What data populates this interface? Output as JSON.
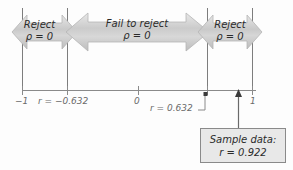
{
  "figure": {
    "axis": {
      "min_label": "−1",
      "zero_label": "0",
      "max_label": "1",
      "critical_low_label": "r = −0.632",
      "critical_high_label": "r = 0.632"
    },
    "bands": [
      {
        "name": "reject-left",
        "line1": "Reject",
        "line2": "ρ = 0"
      },
      {
        "name": "fail-to-reject",
        "line1": "Fail to reject",
        "line2": "ρ = 0"
      },
      {
        "name": "reject-right",
        "line1": "Reject",
        "line2": "ρ = 0"
      }
    ],
    "callout": {
      "line1": "Sample data:",
      "line2": "r = 0.922"
    },
    "colors": {
      "arrow_fill": "#cfcfcf",
      "arrow_stroke": "#b3b3b3",
      "axis": "#8a8a8a",
      "divider": "#7d7d7d",
      "text": "#2b2b2b",
      "label_text": "#6a6a6a",
      "callout_fill": "#e8e8e8",
      "callout_stroke": "#8a8a8a",
      "background": "#fdfdfd"
    }
  }
}
